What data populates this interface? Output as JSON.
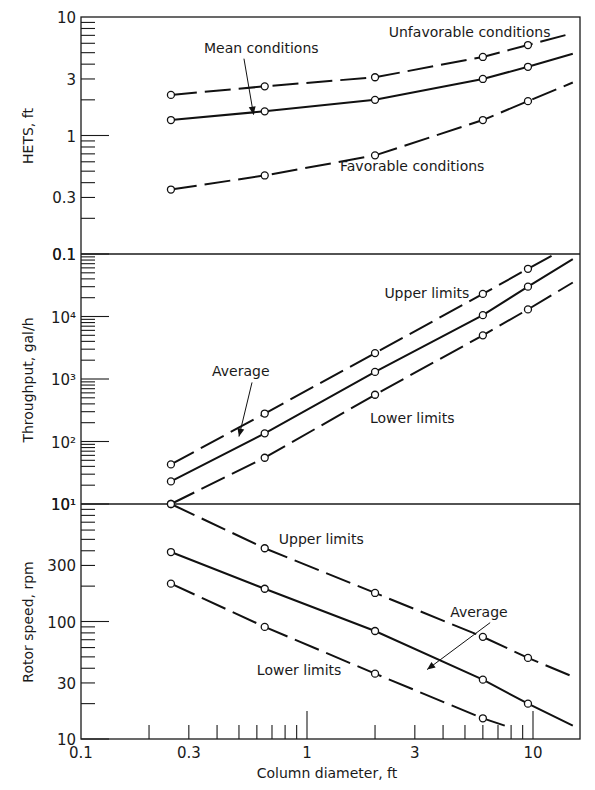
{
  "chart_data": {
    "type": "line",
    "title": "",
    "shared_x": {
      "label": "Column diameter, ft",
      "scale": "log",
      "range": [
        0.1,
        15
      ],
      "tick_labels": [
        "0.1",
        "0.3",
        "1",
        "3",
        "10"
      ],
      "tick_values": [
        0.1,
        0.3,
        1,
        3,
        10
      ]
    },
    "panels": [
      {
        "id": "hets",
        "ylabel": "HETS, ft",
        "yscale": "log",
        "ylim": [
          0.1,
          10
        ],
        "y_tick_labels": [
          "0.1",
          "0.3",
          "1",
          "3",
          "10"
        ],
        "y_tick_values": [
          0.1,
          0.3,
          1,
          3,
          10
        ],
        "series": [
          {
            "name": "Unfavorable conditions",
            "style": "dashed",
            "x": [
              0.25,
              0.65,
              2.0,
              6.0,
              9.5,
              15
            ],
            "y": [
              2.2,
              2.6,
              3.1,
              4.6,
              5.8,
              7.3
            ]
          },
          {
            "name": "Mean conditions",
            "style": "solid",
            "x": [
              0.25,
              0.65,
              2.0,
              6.0,
              9.5,
              15
            ],
            "y": [
              1.35,
              1.6,
              2.0,
              3.0,
              3.8,
              4.9
            ]
          },
          {
            "name": "Favorable conditions",
            "style": "dashed",
            "x": [
              0.25,
              0.65,
              2.0,
              6.0,
              9.5,
              15
            ],
            "y": [
              0.35,
              0.46,
              0.68,
              1.35,
              1.95,
              2.8
            ]
          }
        ],
        "annotations": [
          {
            "text": "Mean conditions",
            "x": 0.35,
            "y": 5.0,
            "arrow_to": [
              0.58,
              1.5
            ]
          },
          {
            "text": "Unfavorable conditions",
            "x": 2.3,
            "y": 6.8
          },
          {
            "text": "Favorable conditions",
            "x": 1.4,
            "y": 0.5
          }
        ]
      },
      {
        "id": "throughput",
        "ylabel": "Throughput, gal/h",
        "yscale": "log",
        "ylim": [
          10,
          100000
        ],
        "y_tick_labels": [
          "10¹",
          "10²",
          "10³",
          "10⁴",
          "0.1"
        ],
        "y_tick_values": [
          10,
          100,
          1000,
          10000,
          100000
        ],
        "series": [
          {
            "name": "Upper limits",
            "style": "dashed",
            "x": [
              0.25,
              0.65,
              2.0,
              6.0,
              9.5,
              12.5
            ],
            "y": [
              43,
              280,
              2600,
              23000,
              58000,
              100000
            ]
          },
          {
            "name": "Average",
            "style": "solid",
            "x": [
              0.25,
              0.65,
              2.0,
              6.0,
              9.5,
              15
            ],
            "y": [
              23,
              135,
              1300,
              10500,
              30000,
              83000
            ]
          },
          {
            "name": "Lower limits",
            "style": "dashed",
            "x": [
              0.25,
              0.65,
              2.0,
              6.0,
              9.5,
              15
            ],
            "y": [
              10,
              55,
              560,
              5000,
              13000,
              35000
            ]
          }
        ],
        "annotations": [
          {
            "text": "Upper limits",
            "x": 2.2,
            "y": 20000
          },
          {
            "text": "Average",
            "x": 0.38,
            "y": 1100,
            "arrow_to": [
              0.5,
              120
            ]
          },
          {
            "text": "Lower limits",
            "x": 1.9,
            "y": 200
          }
        ]
      },
      {
        "id": "rotor-speed",
        "ylabel": "Rotor speed, rpm",
        "yscale": "log",
        "ylim": [
          10,
          1000
        ],
        "y_tick_labels": [
          "10",
          "30",
          "100",
          "300",
          "10¹"
        ],
        "y_tick_values": [
          10,
          30,
          100,
          300,
          1000
        ],
        "series": [
          {
            "name": "Upper limits",
            "style": "dashed",
            "x": [
              0.25,
              0.65,
              2.0,
              6.0,
              9.5,
              15
            ],
            "y": [
              1000,
              420,
              175,
              74,
              49,
              34
            ]
          },
          {
            "name": "Average",
            "style": "solid",
            "x": [
              0.25,
              0.65,
              2.0,
              6.0,
              9.5,
              15
            ],
            "y": [
              390,
              190,
              83,
              32,
              20,
              13
            ]
          },
          {
            "name": "Lower limits",
            "style": "dashed",
            "x": [
              0.25,
              0.65,
              2.0,
              6.0,
              7.5
            ],
            "y": [
              210,
              90,
              36,
              15,
              13
            ]
          }
        ],
        "annotations": [
          {
            "text": "Upper limits",
            "x": 0.75,
            "y": 460
          },
          {
            "text": "Average",
            "x": 4.3,
            "y": 110,
            "arrow_to": [
              3.4,
              39
            ]
          },
          {
            "text": "Lower limits",
            "x": 0.6,
            "y": 35
          }
        ]
      }
    ]
  },
  "labels": {
    "x_axis": "Column diameter, ft",
    "y_axes": [
      "HETS, ft",
      "Throughput, gal/h",
      "Rotor speed, rpm"
    ]
  }
}
